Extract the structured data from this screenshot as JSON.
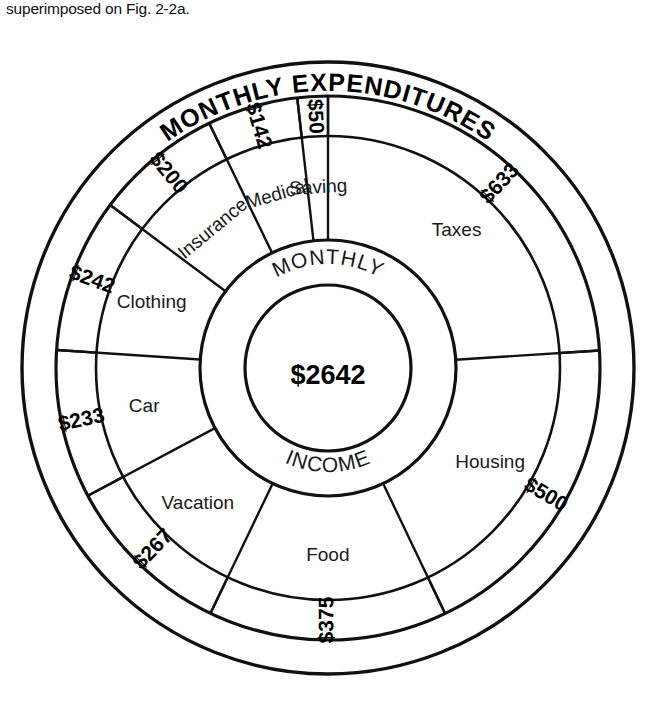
{
  "caption": {
    "text": "superimposed on Fig. 2-2a."
  },
  "banner": {
    "title": "MONTHLY EXPENDITURES"
  },
  "core": {
    "top_arc": "MONTHLY",
    "bottom_arc": "INCOME",
    "total": "$2642"
  },
  "colors": {
    "stroke": "#111111",
    "background": "#ffffff",
    "text": "#1a1a1a"
  },
  "chart_data": {
    "type": "pie",
    "title": "MONTHLY EXPENDITURES",
    "total_label": "$2642",
    "center_text": [
      "MONTHLY",
      "INCOME"
    ],
    "unit": "USD per month",
    "total": 2642,
    "start_angle_deg": 0,
    "direction": "clockwise",
    "categories": [
      "Taxes",
      "Housing",
      "Food",
      "Vacation",
      "Car",
      "Clothing",
      "Insurance",
      "Medical",
      "Saving"
    ],
    "values": [
      633,
      500,
      375,
      267,
      233,
      242,
      200,
      142,
      50
    ],
    "value_labels": [
      "$633",
      "$500",
      "$375",
      "$267",
      "$233",
      "$242",
      "$200",
      "$142",
      "$50"
    ],
    "slices": [
      {
        "label": "Taxes",
        "amount": 633,
        "amount_label": "$633",
        "sweep_deg": 86.3
      },
      {
        "label": "Housing",
        "amount": 500,
        "amount_label": "$500",
        "sweep_deg": 68.2
      },
      {
        "label": "Food",
        "amount": 375,
        "amount_label": "$375",
        "sweep_deg": 51.1
      },
      {
        "label": "Vacation",
        "amount": 267,
        "amount_label": "$267",
        "sweep_deg": 36.4
      },
      {
        "label": "Car",
        "amount": 233,
        "amount_label": "$233",
        "sweep_deg": 31.8
      },
      {
        "label": "Clothing",
        "amount": 242,
        "amount_label": "$242",
        "sweep_deg": 33.0
      },
      {
        "label": "Insurance",
        "amount": 200,
        "amount_label": "$200",
        "sweep_deg": 27.3
      },
      {
        "label": "Medical",
        "amount": 142,
        "amount_label": "$142",
        "sweep_deg": 19.4
      },
      {
        "label": "Saving",
        "amount": 50,
        "amount_label": "$50",
        "sweep_deg": 6.8
      }
    ],
    "legend": "none",
    "grid": false
  }
}
